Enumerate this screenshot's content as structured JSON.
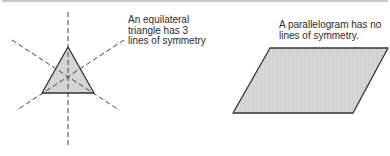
{
  "top_clipped_caption": {
    "note": "partially visible line of text cut off at top edge (unreadable)",
    "text": ""
  },
  "figures": [
    {
      "id": "equilateral-triangle",
      "caption_lines": [
        "An equilateral",
        "triangle has 3",
        "lines of symmetry"
      ],
      "shape": {
        "points": [
          [
            68,
            47
          ],
          [
            42,
            93
          ],
          [
            94,
            93
          ]
        ],
        "fill": "#d9d9d9",
        "stroke": "#333333"
      },
      "symmetry_lines": [
        {
          "x1": 68,
          "y1": 12,
          "x2": 68,
          "y2": 148
        },
        {
          "x1": 12,
          "y1": 40,
          "x2": 119,
          "y2": 110
        },
        {
          "x1": 124,
          "y1": 40,
          "x2": 17,
          "y2": 110
        }
      ],
      "symmetry_line_count": 3
    },
    {
      "id": "parallelogram",
      "caption_lines": [
        "A parallelogram has no",
        "lines of symmetry."
      ],
      "shape": {
        "points": [
          [
            270,
            48
          ],
          [
            388,
            48
          ],
          [
            353,
            113
          ],
          [
            233,
            113
          ]
        ],
        "fill": "#d9d9d9",
        "stroke": "#333333"
      },
      "symmetry_line_count": 0
    }
  ],
  "colors": {
    "shape_fill": "#d9d9d9",
    "hatch": "#c8c8c8",
    "stroke": "#333333",
    "dash": "#444444",
    "text": "#2a2a2a"
  }
}
